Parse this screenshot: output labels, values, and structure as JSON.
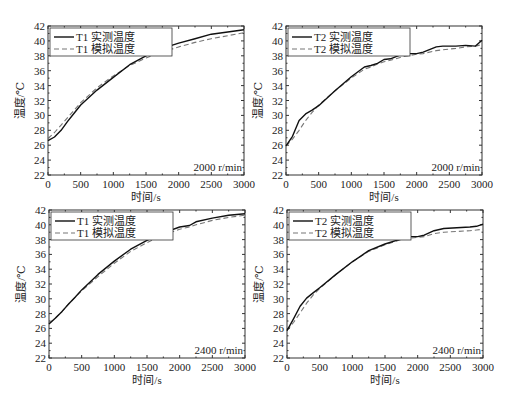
{
  "chart_data": [
    {
      "type": "line",
      "panel": "top-left",
      "frame": {
        "x0": 48,
        "x1": 244,
        "y0": 26,
        "y1": 175
      },
      "xlabel": "时间/s",
      "ylabel": "温度/℃",
      "xlim": [
        0,
        3000
      ],
      "ylim": [
        22,
        42
      ],
      "xticks": [
        0,
        500,
        1000,
        1500,
        2000,
        2500,
        3000
      ],
      "yticks": [
        22,
        24,
        26,
        28,
        30,
        32,
        34,
        36,
        38,
        40,
        42
      ],
      "grid": false,
      "legend_position": "upper-left",
      "annotation": "2000 r/min",
      "x": [
        0,
        100,
        200,
        300,
        400,
        500,
        750,
        1000,
        1250,
        1500,
        1750,
        2000,
        2250,
        2500,
        2750,
        3000
      ],
      "series": [
        {
          "name": "T1 实测温度",
          "style": "solid",
          "values": [
            26.6,
            27.1,
            28.0,
            29.2,
            30.3,
            31.4,
            33.4,
            35.1,
            36.8,
            38.0,
            39.0,
            39.7,
            40.3,
            40.9,
            41.2,
            41.5
          ]
        },
        {
          "name": "T1 模拟温度",
          "style": "dashed",
          "values": [
            26.9,
            27.7,
            28.7,
            29.7,
            30.7,
            31.7,
            33.7,
            35.3,
            36.7,
            37.7,
            38.5,
            39.2,
            39.8,
            40.3,
            40.7,
            41.1
          ]
        }
      ]
    },
    {
      "type": "line",
      "panel": "top-right",
      "frame": {
        "x0": 286,
        "x1": 482,
        "y0": 26,
        "y1": 175
      },
      "xlabel": "时间/s",
      "ylabel": "温度/℃",
      "xlim": [
        0,
        3000
      ],
      "ylim": [
        22,
        42
      ],
      "xticks": [
        0,
        500,
        1000,
        1500,
        2000,
        2500,
        3000
      ],
      "yticks": [
        22,
        24,
        26,
        28,
        30,
        32,
        34,
        36,
        38,
        40,
        42
      ],
      "grid": false,
      "legend_position": "upper-left",
      "annotation": "2000 r/min",
      "x": [
        0,
        100,
        200,
        300,
        400,
        500,
        750,
        1000,
        1200,
        1300,
        1400,
        1500,
        1600,
        1800,
        2000,
        2100,
        2300,
        2400,
        2600,
        2750,
        2900,
        3000
      ],
      "series": [
        {
          "name": "T2 实测温度",
          "style": "solid",
          "values": [
            25.9,
            27.2,
            29.3,
            30.2,
            30.7,
            31.3,
            33.3,
            35.2,
            36.5,
            36.7,
            37.0,
            37.5,
            37.6,
            38.3,
            38.3,
            38.5,
            39.2,
            39.3,
            39.3,
            39.4,
            39.3,
            40.1
          ]
        },
        {
          "name": "T2 模拟温度",
          "style": "dashed",
          "values": [
            25.9,
            26.8,
            28.0,
            29.3,
            30.4,
            31.4,
            33.3,
            35.0,
            36.2,
            36.5,
            36.9,
            37.2,
            37.4,
            37.9,
            38.2,
            38.3,
            38.7,
            38.8,
            39.0,
            39.2,
            39.3,
            39.5
          ]
        }
      ]
    },
    {
      "type": "line",
      "panel": "bottom-left",
      "frame": {
        "x0": 49,
        "x1": 245,
        "y0": 210,
        "y1": 358
      },
      "xlabel": "时间/s",
      "ylabel": "温度/℃",
      "xlim": [
        0,
        3000
      ],
      "ylim": [
        22,
        42
      ],
      "xticks": [
        0,
        500,
        1000,
        1500,
        2000,
        2500,
        3000
      ],
      "yticks": [
        22,
        24,
        26,
        28,
        30,
        32,
        34,
        36,
        38,
        40,
        42
      ],
      "grid": false,
      "legend_position": "upper-left",
      "annotation": "2400 r/min",
      "x": [
        0,
        100,
        200,
        300,
        400,
        500,
        750,
        1000,
        1250,
        1500,
        1750,
        2000,
        2150,
        2250,
        2500,
        2750,
        3000
      ],
      "series": [
        {
          "name": "T1 实测温度",
          "style": "solid",
          "values": [
            26.6,
            27.4,
            28.3,
            29.3,
            30.2,
            31.2,
            33.3,
            35.1,
            36.7,
            37.9,
            38.9,
            39.7,
            39.9,
            40.4,
            40.9,
            41.3,
            41.5
          ]
        },
        {
          "name": "T1 模拟温度",
          "style": "dashed",
          "values": [
            26.7,
            27.4,
            28.3,
            29.3,
            30.2,
            31.1,
            33.0,
            34.8,
            36.4,
            37.6,
            38.6,
            39.4,
            39.7,
            40.0,
            40.6,
            41.0,
            41.3
          ]
        }
      ]
    },
    {
      "type": "line",
      "panel": "bottom-right",
      "frame": {
        "x0": 287,
        "x1": 483,
        "y0": 210,
        "y1": 358
      },
      "xlabel": "时间/s",
      "ylabel": "温度/℃",
      "xlim": [
        0,
        3000
      ],
      "ylim": [
        22,
        42
      ],
      "xticks": [
        0,
        500,
        1000,
        1500,
        2000,
        2500,
        3000
      ],
      "yticks": [
        22,
        24,
        26,
        28,
        30,
        32,
        34,
        36,
        38,
        40,
        42
      ],
      "grid": false,
      "legend_position": "upper-left",
      "annotation": "2400 r/min",
      "x": [
        0,
        100,
        200,
        300,
        400,
        500,
        750,
        1000,
        1250,
        1500,
        1750,
        1900,
        2000,
        2100,
        2250,
        2400,
        2600,
        2800,
        2900,
        3000
      ],
      "series": [
        {
          "name": "T2 实测温度",
          "style": "solid",
          "values": [
            25.7,
            27.3,
            29.0,
            30.1,
            30.8,
            31.5,
            33.3,
            35.0,
            36.5,
            37.4,
            38.1,
            38.4,
            38.4,
            38.6,
            39.2,
            39.5,
            39.6,
            39.7,
            39.8,
            40.1
          ]
        },
        {
          "name": "T2 模拟温度",
          "style": "dashed",
          "values": [
            25.7,
            26.8,
            28.1,
            29.4,
            30.5,
            31.4,
            33.3,
            35.0,
            36.4,
            37.3,
            38.0,
            38.2,
            38.3,
            38.4,
            38.8,
            39.0,
            39.1,
            39.2,
            39.3,
            39.4
          ]
        }
      ]
    }
  ]
}
